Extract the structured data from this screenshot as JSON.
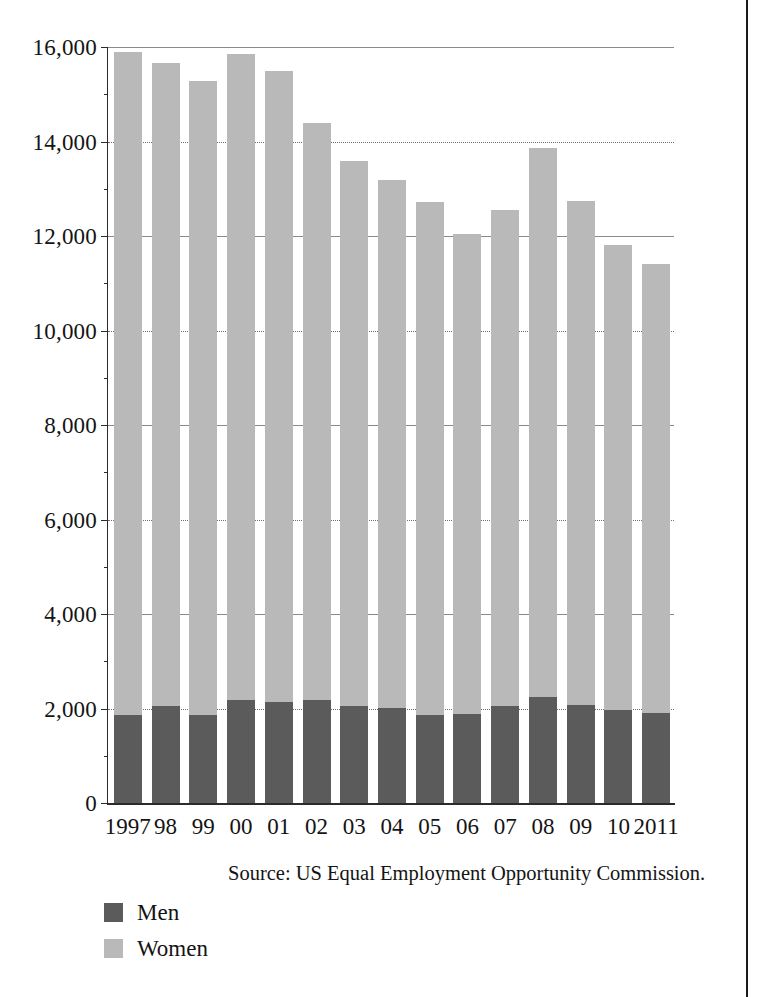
{
  "chart_data": {
    "type": "bar",
    "stacked": true,
    "title": "",
    "xlabel": "",
    "ylabel": "",
    "ylim": [
      0,
      16000
    ],
    "ytick_values": [
      0,
      2000,
      4000,
      6000,
      8000,
      10000,
      12000,
      14000,
      16000
    ],
    "ytick_labels": [
      "0",
      "2,000",
      "4,000",
      "6,000",
      "8,000",
      "10,000",
      "12,000",
      "14,000",
      "16,000"
    ],
    "grid": true,
    "legend_position": "bottom-left",
    "categories": [
      "1997",
      "98",
      "99",
      "00",
      "01",
      "02",
      "03",
      "04",
      "05",
      "06",
      "07",
      "08",
      "09",
      "10",
      "2011"
    ],
    "series": [
      {
        "name": "Men",
        "color": "#5b5b5b",
        "values": [
          1870,
          2060,
          1860,
          2180,
          2140,
          2180,
          2050,
          2010,
          1870,
          1880,
          2050,
          2240,
          2080,
          1970,
          1900
        ]
      },
      {
        "name": "Women",
        "color": "#b9b9b9",
        "values": [
          14030,
          13600,
          13410,
          13680,
          13360,
          12220,
          11530,
          11170,
          10860,
          10160,
          10490,
          11630,
          10660,
          9840,
          9500
        ]
      }
    ],
    "totals": [
      15900,
      15660,
      15270,
      15860,
      15500,
      14400,
      13580,
      13180,
      12730,
      12040,
      12540,
      13870,
      12740,
      11810,
      11400
    ],
    "source_note": "Source: US Equal Employment Opportunity Commission."
  },
  "legend": {
    "items": [
      {
        "label": "Men",
        "color": "#5b5b5b"
      },
      {
        "label": "Women",
        "color": "#b9b9b9"
      }
    ]
  },
  "notes": {
    "source": "Source: US Equal Employment Opportunity Commission."
  },
  "colors": {
    "men": "#5b5b5b",
    "women": "#b9b9b9",
    "axis": "#2b2b2b",
    "grid": "#6e6e6e",
    "background": "#ffffff"
  }
}
